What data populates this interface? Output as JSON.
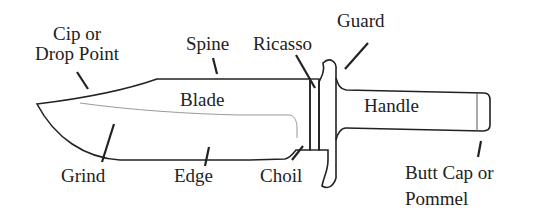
{
  "diagram": {
    "colors": {
      "line": "#222222",
      "text": "#222222",
      "background": "#ffffff",
      "grind_line": "#9a9a9a"
    },
    "labels": {
      "cip_line1": "Cip or",
      "cip_line2": "Drop Point",
      "spine": "Spine",
      "ricasso": "Ricasso",
      "guard": "Guard",
      "blade": "Blade",
      "handle": "Handle",
      "grind": "Grind",
      "edge": "Edge",
      "choil": "Choil",
      "butt_line1": "Butt Cap or",
      "butt_line2": "Pommel"
    }
  }
}
